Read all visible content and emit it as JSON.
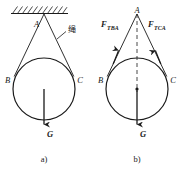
{
  "figure": {
    "caption_a": "a)",
    "caption_b": "b)",
    "colors": {
      "stroke": "#1a1a1a",
      "background": "#ffffff",
      "hatch": "#1a1a1a"
    }
  },
  "panel_a": {
    "name": "physical-setup",
    "caption": "a)",
    "labels": {
      "point_a": "A",
      "point_b": "B",
      "point_c": "C",
      "rope": "绳",
      "weight": "G"
    },
    "geometry": {
      "ceiling_y": 13,
      "ceiling_x1": 11,
      "ceiling_x2": 68,
      "apex_x": 44,
      "apex_y": 17,
      "circle_cx": 44,
      "circle_cy": 89,
      "circle_r": 31,
      "weight_arrow_from_y": 89,
      "weight_arrow_to_y": 131
    }
  },
  "panel_b": {
    "name": "free-body-diagram",
    "caption": "b)",
    "labels": {
      "point_a": "A",
      "point_b": "B",
      "point_c": "C",
      "weight": "G",
      "force_left_base": "F",
      "force_left_sub": "TBA",
      "force_right_base": "F",
      "force_right_sub": "TCA"
    },
    "geometry": {
      "apex_x": 137,
      "apex_y": 17,
      "circle_cx": 137,
      "circle_cy": 89,
      "circle_r": 31,
      "axis_dashed": true,
      "weight_arrow_from_y": 89,
      "weight_arrow_to_y": 131
    }
  }
}
